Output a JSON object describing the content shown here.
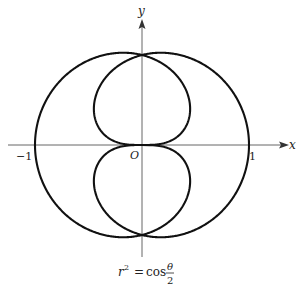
{
  "chart_data": {
    "type": "line",
    "subtype": "polar-curve",
    "equation": {
      "lhs_base": "r",
      "lhs_exp": "2",
      "equals": "=",
      "func": "cos",
      "numerator": "θ",
      "denominator": "2"
    },
    "xlabel": "x",
    "ylabel": "y",
    "tick_labels": {
      "x_neg": "−1",
      "x_pos": "1",
      "origin": "O"
    },
    "xlim": [
      -1.3,
      1.3
    ],
    "ylim": [
      -1.05,
      1.2
    ],
    "theta_range": [
      0,
      12.566
    ],
    "grid": false,
    "legend": null,
    "series": [
      {
        "name": "r^2 = cos(theta/2)",
        "color": "#111111"
      }
    ]
  },
  "layout": {
    "origin_px": [
      142,
      145
    ],
    "scale_x": 107,
    "scale_y": 107
  }
}
